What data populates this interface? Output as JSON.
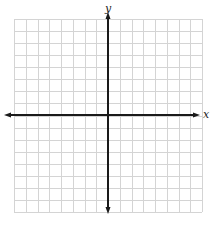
{
  "diagram": {
    "type": "coordinate-plane",
    "x_axis_label": "x",
    "y_axis_label": "y",
    "grid": {
      "columns": 16,
      "rows": 16,
      "left": 14,
      "top": 19,
      "right": 202,
      "bottom": 212,
      "line_color": "#d4d4d4"
    },
    "axes": {
      "origin_x": 108,
      "origin_y": 115,
      "color": "#1a1a1a",
      "x_start": 4,
      "x_end": 200,
      "y_start": 12,
      "y_end": 214,
      "arrows": "both-ends"
    }
  }
}
